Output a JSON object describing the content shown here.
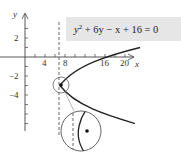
{
  "figure": {
    "equation": {
      "base": "y",
      "exp": "2",
      "rest": " + 6y − x + 16 = 0",
      "box_color": "#e6e6e6"
    },
    "axes": {
      "x_label": "x",
      "y_label": "y",
      "x_ticks": [
        {
          "value": 4,
          "label": "4"
        },
        {
          "value": 8,
          "label": "8"
        },
        {
          "value": 16,
          "label": "16"
        },
        {
          "value": 20,
          "label": "20"
        }
      ],
      "y_ticks": [
        {
          "value": 2,
          "label": "2"
        },
        {
          "value": -2,
          "label": "−2"
        },
        {
          "value": -4,
          "label": "−4"
        }
      ]
    },
    "directrix_x": 7.75,
    "vertex": {
      "x": 7,
      "y": -3
    },
    "curve": "x = (y+3)^2 + 7",
    "colors": {
      "curve": "#222222",
      "axis": "#444444",
      "circle": "#666666",
      "dash": "#555555"
    }
  }
}
